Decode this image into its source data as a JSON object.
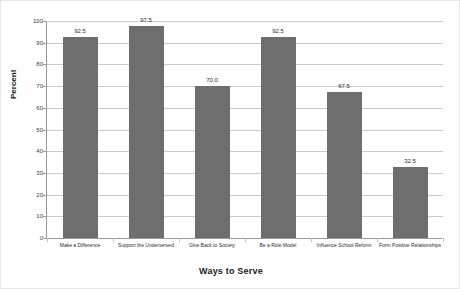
{
  "chart_data": {
    "type": "bar",
    "title": "",
    "categories": [
      "Make a Difference",
      "Support the Underserved",
      "Give Back to Society",
      "Be a Role Model",
      "Influence School Reform",
      "Form Positive Relationships"
    ],
    "values": [
      92.5,
      97.5,
      70.0,
      92.5,
      67.5,
      32.5
    ],
    "value_labels": [
      "92.5",
      "97.5",
      "70.0",
      "92.5",
      "67.5",
      "32.5"
    ],
    "xlabel": "Ways to Serve",
    "ylabel": "Percent",
    "ylim": [
      0,
      100
    ],
    "ytick_step": 10,
    "ytick_labels": [
      "0",
      "10",
      "20",
      "30",
      "40",
      "50",
      "60",
      "70",
      "80",
      "90",
      "100"
    ],
    "grid": true,
    "legend": false,
    "bar_color": "#6e6e6e",
    "gridline_color": "#c9c9c9",
    "axis_color": "#9a9a9a",
    "background_color": "#ffffff"
  }
}
